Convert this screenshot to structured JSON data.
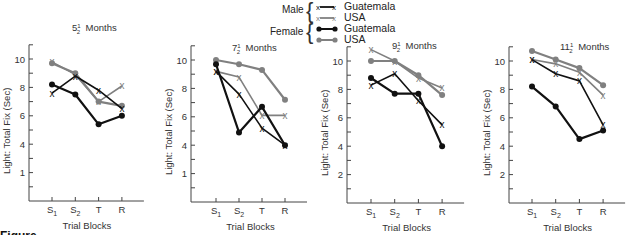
{
  "legend": {
    "male_label": "Male",
    "female_label": "Female",
    "entries": [
      {
        "group": "Male",
        "label": "Guatemala",
        "marker": "x",
        "color": "#111111"
      },
      {
        "group": "Male",
        "label": "USA",
        "marker": "x",
        "color": "#808080"
      },
      {
        "group": "Female",
        "label": "Guatemala",
        "marker": "dot",
        "color": "#111111"
      },
      {
        "group": "Female",
        "label": "USA",
        "marker": "dot",
        "color": "#808080"
      }
    ]
  },
  "caption_partial": "Figure",
  "colors": {
    "guatemala": "#111111",
    "usa": "#808080",
    "axis": "#444444"
  },
  "chart_data": [
    {
      "type": "line",
      "title_main": "5",
      "title_frac": "1/2",
      "title_suffix": "Months",
      "title": "5 1/2 Months",
      "xlabel": "Trial Blocks",
      "ylabel": "Light: Total Fix (Sec)",
      "categories": [
        "S1",
        "S2",
        "T",
        "R"
      ],
      "yticks": [
        10,
        8,
        6,
        4,
        2
      ],
      "ytick_labels": [
        "10",
        "8",
        "6",
        "4",
        "1"
      ],
      "ylim": [
        0,
        11
      ],
      "grid": false,
      "series": [
        {
          "name": "Male Guatemala",
          "marker": "x",
          "color": "#111111",
          "values": [
            7.6,
            8.8,
            7.8,
            6.5
          ]
        },
        {
          "name": "Male USA",
          "marker": "x",
          "color": "#808080",
          "values": [
            9.8,
            8.9,
            7.0,
            8.1
          ]
        },
        {
          "name": "Female Guatemala",
          "marker": "dot",
          "color": "#111111",
          "values": [
            8.2,
            7.5,
            5.4,
            6.0
          ]
        },
        {
          "name": "Female USA",
          "marker": "dot",
          "color": "#808080",
          "values": [
            9.7,
            9.0,
            7.0,
            6.7
          ]
        }
      ]
    },
    {
      "type": "line",
      "title_main": "7",
      "title_frac": "1/2",
      "title_suffix": "Months",
      "title": "7 1/2 Months",
      "xlabel": "Trial Blocks",
      "ylabel": "Light: Total Fix (Sec)",
      "categories": [
        "S1",
        "S2",
        "T",
        "R"
      ],
      "yticks": [
        10,
        8,
        6,
        4,
        2
      ],
      "ytick_labels": [
        "10",
        "8",
        "6",
        "4",
        "1"
      ],
      "ylim": [
        0,
        11
      ],
      "grid": false,
      "series": [
        {
          "name": "Male Guatemala",
          "marker": "x",
          "color": "#111111",
          "values": [
            9.2,
            7.6,
            5.2,
            4.0
          ]
        },
        {
          "name": "Male USA",
          "marker": "x",
          "color": "#808080",
          "values": [
            9.2,
            8.8,
            6.1,
            6.1
          ]
        },
        {
          "name": "Female Guatemala",
          "marker": "dot",
          "color": "#111111",
          "values": [
            9.7,
            4.9,
            6.7,
            4.0
          ]
        },
        {
          "name": "Female USA",
          "marker": "dot",
          "color": "#808080",
          "values": [
            10.0,
            9.7,
            9.3,
            7.2
          ]
        }
      ]
    },
    {
      "type": "line",
      "title_main": "9",
      "title_frac": "1/2",
      "title_suffix": "Months",
      "title": "9 1/2 Months",
      "xlabel": "Trial Blocks",
      "ylabel": "Light: Total Fix (Sec)",
      "categories": [
        "S1",
        "S2",
        "T",
        "R"
      ],
      "yticks": [
        10,
        8,
        6,
        4,
        2
      ],
      "ytick_labels": [
        "10",
        "8",
        "6",
        "4",
        "2"
      ],
      "ylim": [
        0,
        11
      ],
      "grid": false,
      "series": [
        {
          "name": "Male Guatemala",
          "marker": "x",
          "color": "#111111",
          "values": [
            8.3,
            9.1,
            7.2,
            5.5
          ]
        },
        {
          "name": "Male USA",
          "marker": "x",
          "color": "#808080",
          "values": [
            10.8,
            10.0,
            8.8,
            8.1
          ]
        },
        {
          "name": "Female Guatemala",
          "marker": "dot",
          "color": "#111111",
          "values": [
            8.8,
            7.7,
            7.7,
            4.0
          ]
        },
        {
          "name": "Female USA",
          "marker": "dot",
          "color": "#808080",
          "values": [
            10.0,
            10.0,
            9.0,
            7.6
          ]
        }
      ]
    },
    {
      "type": "line",
      "title_main": "11",
      "title_frac": "1/2",
      "title_suffix": "Months",
      "title": "11 1/2 Months",
      "xlabel": "Trial Blocks",
      "ylabel": "Light: Total Fix (Sec)",
      "categories": [
        "S1",
        "S2",
        "T",
        "R"
      ],
      "yticks": [
        10,
        8,
        6,
        4,
        2
      ],
      "ytick_labels": [
        "10",
        "8",
        "6",
        "4",
        "2"
      ],
      "ylim": [
        0,
        11
      ],
      "grid": false,
      "series": [
        {
          "name": "Male Guatemala",
          "marker": "x",
          "color": "#111111",
          "values": [
            10.1,
            9.1,
            8.6,
            5.5
          ]
        },
        {
          "name": "Male USA",
          "marker": "x",
          "color": "#808080",
          "values": [
            10.1,
            9.8,
            9.2,
            7.6
          ]
        },
        {
          "name": "Female Guatemala",
          "marker": "dot",
          "color": "#111111",
          "values": [
            8.2,
            6.8,
            4.5,
            5.1
          ]
        },
        {
          "name": "Female USA",
          "marker": "dot",
          "color": "#808080",
          "values": [
            10.7,
            10.1,
            9.5,
            8.3
          ]
        }
      ]
    }
  ]
}
